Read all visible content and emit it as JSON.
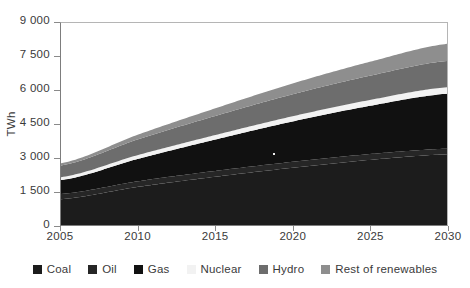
{
  "figure": {
    "title_sliver": "",
    "background": "#ffffff"
  },
  "axes": {
    "y_title": "TWh",
    "y_ticks": [
      "0",
      "1 500",
      "3 000",
      "4 500",
      "6 000",
      "7 500",
      "9 000"
    ],
    "x_ticks": [
      "2005",
      "2010",
      "2015",
      "2020",
      "2025",
      "2030"
    ]
  },
  "legend": {
    "items": [
      {
        "label": "Coal",
        "color": "#1c1c1c"
      },
      {
        "label": "Oil",
        "color": "#262626"
      },
      {
        "label": "Gas",
        "color": "#111111"
      },
      {
        "label": "Nuclear",
        "color": "#f2f2f2"
      },
      {
        "label": "Hydro",
        "color": "#6d6d6d"
      },
      {
        "label": "Rest of renewables",
        "color": "#8e8e8e"
      }
    ]
  },
  "chart_data": {
    "type": "area",
    "stacked": true,
    "title": "",
    "xlabel": "",
    "ylabel": "TWh",
    "xlim": [
      2005,
      2030
    ],
    "ylim": [
      0,
      9000
    ],
    "grid": false,
    "legend_position": "bottom",
    "x": [
      2005,
      2010,
      2015,
      2020,
      2025,
      2030
    ],
    "series": [
      {
        "name": "Coal",
        "color": "#1c1c1c",
        "values": [
          1150,
          1700,
          2150,
          2550,
          2900,
          3150
        ]
      },
      {
        "name": "Oil",
        "color": "#262626",
        "values": [
          230,
          250,
          260,
          265,
          260,
          250
        ]
      },
      {
        "name": "Gas",
        "color": "#111111",
        "values": [
          620,
          1000,
          1400,
          1800,
          2150,
          2450
        ]
      },
      {
        "name": "Nuclear",
        "color": "#f2f2f2",
        "values": [
          130,
          170,
          200,
          230,
          260,
          290
        ]
      },
      {
        "name": "Hydro",
        "color": "#6d6d6d",
        "values": [
          520,
          700,
          850,
          980,
          1080,
          1170
        ]
      },
      {
        "name": "Rest of renewables",
        "color": "#8e8e8e",
        "values": [
          100,
          210,
          340,
          480,
          620,
          760
        ]
      }
    ],
    "totals": [
      2750,
      4030,
      5200,
      6305,
      7270,
      8070
    ],
    "annotations": []
  }
}
